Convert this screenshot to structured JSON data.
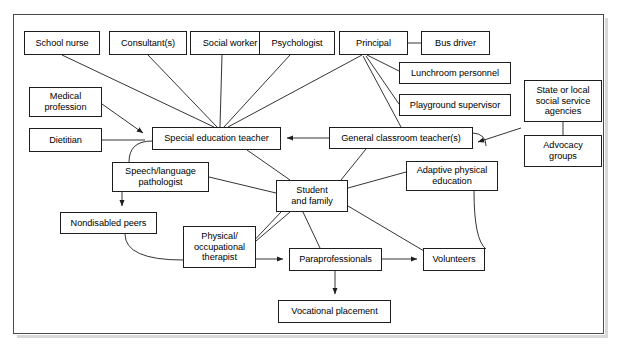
{
  "figure": {
    "kind": "flow-diagram",
    "title_visible": false,
    "frame": {
      "x": 13,
      "y": 14,
      "w": 591,
      "h": 320,
      "border_color": "#4a4a4a"
    }
  },
  "style": {
    "node_border_color": "#1d1d1d",
    "node_fill_color": "#ffffff",
    "edge_color": "#1d1d1d",
    "text_color": "#000000",
    "page_background": "#ffffff"
  },
  "nodes": [
    {
      "id": "school-nurse",
      "label": "School nurse",
      "x": 24,
      "y": 31,
      "w": 76,
      "h": 24
    },
    {
      "id": "consultants",
      "label": "Consultant(s)",
      "x": 109,
      "y": 31,
      "w": 78,
      "h": 24
    },
    {
      "id": "social-worker",
      "label": "Social worker",
      "x": 190,
      "y": 31,
      "w": 80,
      "h": 24
    },
    {
      "id": "psychologist",
      "label": "Psychologist",
      "x": 259,
      "y": 31,
      "w": 76,
      "h": 24
    },
    {
      "id": "principal",
      "label": "Principal",
      "x": 339,
      "y": 31,
      "w": 69,
      "h": 24
    },
    {
      "id": "bus-driver",
      "label": "Bus driver",
      "x": 421,
      "y": 31,
      "w": 69,
      "h": 24
    },
    {
      "id": "lunchroom-personnel",
      "label": "Lunchroom personnel",
      "x": 399,
      "y": 62,
      "w": 112,
      "h": 22
    },
    {
      "id": "playground-supervisor",
      "label": "Playground supervisor",
      "x": 399,
      "y": 94,
      "w": 112,
      "h": 22
    },
    {
      "id": "state-local-agencies",
      "label": "State or local\nsocial service\nagencies",
      "x": 524,
      "y": 80,
      "w": 78,
      "h": 42
    },
    {
      "id": "advocacy-groups",
      "label": "Advocacy\ngroups",
      "x": 524,
      "y": 135,
      "w": 78,
      "h": 32
    },
    {
      "id": "medical-profession",
      "label": "Medical\nprofession",
      "x": 29,
      "y": 87,
      "w": 73,
      "h": 30
    },
    {
      "id": "dietitian",
      "label": "Dietitian",
      "x": 29,
      "y": 128,
      "w": 73,
      "h": 24
    },
    {
      "id": "special-ed-teacher",
      "label": "Special education teacher",
      "x": 152,
      "y": 127,
      "w": 129,
      "h": 23
    },
    {
      "id": "general-classroom-teacher",
      "label": "General classroom teacher(s)",
      "x": 329,
      "y": 127,
      "w": 144,
      "h": 22
    },
    {
      "id": "speech-language-pathologist",
      "label": "Speech/language\npathologist",
      "x": 112,
      "y": 162,
      "w": 97,
      "h": 30
    },
    {
      "id": "student-and-family",
      "label": "Student\nand family",
      "x": 276,
      "y": 180,
      "w": 72,
      "h": 32
    },
    {
      "id": "adaptive-pe",
      "label": "Adaptive physical\neducation",
      "x": 406,
      "y": 161,
      "w": 92,
      "h": 30
    },
    {
      "id": "nondisabled-peers",
      "label": "Nondisabled peers",
      "x": 60,
      "y": 212,
      "w": 97,
      "h": 22
    },
    {
      "id": "physical-occupational-therapist",
      "label": "Physical/\noccupational\ntherapist",
      "x": 183,
      "y": 226,
      "w": 73,
      "h": 42
    },
    {
      "id": "paraprofessionals",
      "label": "Paraprofessionals",
      "x": 289,
      "y": 248,
      "w": 93,
      "h": 23
    },
    {
      "id": "volunteers",
      "label": "Volunteers",
      "x": 423,
      "y": 248,
      "w": 62,
      "h": 23
    },
    {
      "id": "vocational-placement",
      "label": "Vocational placement",
      "x": 278,
      "y": 300,
      "w": 113,
      "h": 23
    }
  ],
  "edges": [
    {
      "from": "school-nurse",
      "to": "special-ed-teacher",
      "arrow": false
    },
    {
      "from": "consultants",
      "to": "special-ed-teacher",
      "arrow": false
    },
    {
      "from": "social-worker",
      "to": "special-ed-teacher",
      "arrow": false
    },
    {
      "from": "psychologist",
      "to": "special-ed-teacher",
      "arrow": false
    },
    {
      "from": "principal",
      "to": "bus-driver",
      "arrow": false
    },
    {
      "from": "principal",
      "to": "lunchroom-personnel",
      "arrow": false
    },
    {
      "from": "principal",
      "to": "playground-supervisor",
      "arrow": false
    },
    {
      "from": "principal",
      "to": "general-classroom-teacher",
      "arrow": false
    },
    {
      "from": "principal",
      "to": "special-ed-teacher",
      "arrow": false
    },
    {
      "from": "state-local-agencies",
      "to": "advocacy-groups",
      "arrow": false
    },
    {
      "from": "state-local-agencies",
      "to": "general-classroom-teacher",
      "arrow": true
    },
    {
      "from": "medical-profession",
      "to": "special-ed-teacher",
      "arrow": true
    },
    {
      "from": "dietitian",
      "to": "special-ed-teacher",
      "arrow": true
    },
    {
      "from": "general-classroom-teacher",
      "to": "special-ed-teacher",
      "arrow": true
    },
    {
      "from": "special-ed-teacher",
      "to": "speech-language-pathologist",
      "arrow": false
    },
    {
      "from": "special-ed-teacher",
      "to": "student-and-family",
      "arrow": false
    },
    {
      "from": "speech-language-pathologist",
      "to": "nondisabled-peers",
      "arrow": true
    },
    {
      "from": "speech-language-pathologist",
      "to": "student-and-family",
      "arrow": false
    },
    {
      "from": "general-classroom-teacher",
      "to": "student-and-family",
      "arrow": false
    },
    {
      "from": "adaptive-pe",
      "to": "student-and-family",
      "arrow": false
    },
    {
      "from": "adaptive-pe",
      "to": "volunteers",
      "arrow": false
    },
    {
      "from": "nondisabled-peers",
      "to": "physical-occupational-therapist",
      "arrow": false
    },
    {
      "from": "physical-occupational-therapist",
      "to": "student-and-family",
      "arrow": false
    },
    {
      "from": "physical-occupational-therapist",
      "to": "paraprofessionals",
      "arrow": true
    },
    {
      "from": "student-and-family",
      "to": "paraprofessionals",
      "arrow": false
    },
    {
      "from": "student-and-family",
      "to": "volunteers",
      "arrow": false
    },
    {
      "from": "student-and-family",
      "to": "physical-occupational-therapist",
      "arrow": false
    },
    {
      "from": "paraprofessionals",
      "to": "volunteers",
      "arrow": true
    },
    {
      "from": "paraprofessionals",
      "to": "vocational-placement",
      "arrow": true
    }
  ]
}
